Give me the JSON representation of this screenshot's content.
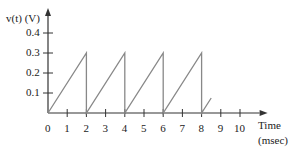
{
  "chart_data": {
    "type": "line",
    "title": "",
    "xlabel": "Time",
    "xlabel_units": "(msec)",
    "ylabel": "v(t) (V)",
    "x_ticks": [
      "0",
      "1",
      "2",
      "3",
      "4",
      "5",
      "6",
      "7",
      "8",
      "9",
      "10"
    ],
    "y_ticks": [
      "0.1",
      "0.2",
      "0.3",
      "0.4"
    ],
    "xlim": [
      0,
      10.5
    ],
    "ylim": [
      0,
      0.45
    ],
    "grid": false,
    "legend": null,
    "series": [
      {
        "name": "v(t) sawtooth",
        "color": "#888888",
        "x": [
          0,
          2,
          2,
          4,
          4,
          6,
          6,
          8,
          8,
          8.5
        ],
        "y": [
          0,
          0.3,
          0,
          0.3,
          0,
          0.3,
          0,
          0.3,
          0,
          0.075
        ]
      }
    ]
  },
  "labels": {
    "ylabel": "v(t) (V)",
    "xlabel": "Time",
    "xunits": "(msec)"
  }
}
